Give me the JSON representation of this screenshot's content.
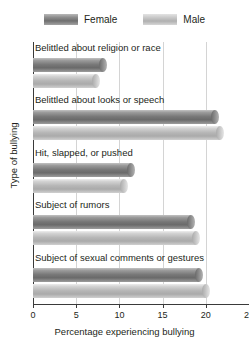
{
  "chart_data": {
    "type": "bar",
    "orientation": "horizontal",
    "title": "",
    "xlabel": "Percentage experiencing bullying",
    "ylabel": "Type of bullying",
    "xlim": [
      0,
      25
    ],
    "xticks": [
      0,
      5,
      10,
      15,
      20,
      25
    ],
    "xticklabels": [
      "0",
      "5",
      "10",
      "15",
      "20",
      "25"
    ],
    "grid": true,
    "legend_position": "top",
    "categories": [
      "Belittled about religion or race",
      "Belittled about looks or speech",
      "Hit, slapped, or pushed",
      "Subject of rumors",
      "Subject of sexual comments or gestures"
    ],
    "series": [
      {
        "name": "Female",
        "color": "#777777",
        "values": [
          8.6,
          21.5,
          11.8,
          18.7,
          19.7
        ]
      },
      {
        "name": "Male",
        "color": "#b6b6b6",
        "values": [
          7.8,
          22.1,
          11.0,
          19.3,
          20.5
        ]
      }
    ]
  },
  "legend": {
    "entries": [
      {
        "label": "Female",
        "swatch": "female-swatch"
      },
      {
        "label": "Male",
        "swatch": "male-swatch"
      }
    ]
  }
}
